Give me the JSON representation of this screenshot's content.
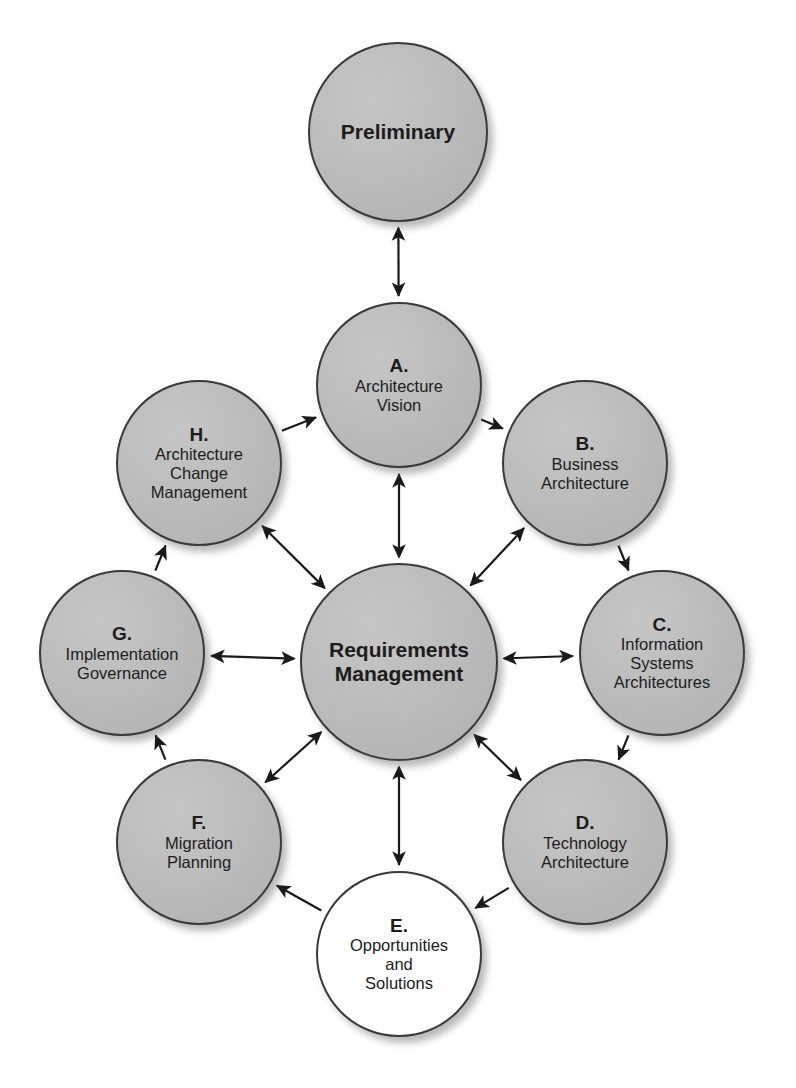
{
  "diagram": {
    "colors": {
      "node_fill": "#b9b9b9",
      "node_fill_white": "#ffffff",
      "node_border": "#3a3a3a",
      "arrow": "#1a1a1a",
      "background": "#ffffff"
    },
    "nodes": [
      {
        "id": "preliminary",
        "key": "",
        "text": "Preliminary",
        "fill": "gray",
        "bold": true,
        "cx": 398,
        "cy": 132,
        "r": 90
      },
      {
        "id": "phase-a",
        "key": "A.",
        "text": "Architecture\nVision",
        "fill": "gray",
        "bold": false,
        "cx": 399,
        "cy": 385,
        "r": 83
      },
      {
        "id": "phase-b",
        "key": "B.",
        "text": "Business\nArchitecture",
        "fill": "gray",
        "bold": false,
        "cx": 585,
        "cy": 463,
        "r": 83
      },
      {
        "id": "phase-c",
        "key": "C.",
        "text": "Information\nSystems\nArchitectures",
        "fill": "gray",
        "bold": false,
        "cx": 662,
        "cy": 653,
        "r": 83
      },
      {
        "id": "phase-d",
        "key": "D.",
        "text": "Technology\nArchitecture",
        "fill": "gray",
        "bold": false,
        "cx": 585,
        "cy": 842,
        "r": 83
      },
      {
        "id": "phase-e",
        "key": "E.",
        "text": "Opportunities\nand\nSolutions",
        "fill": "white",
        "bold": false,
        "cx": 399,
        "cy": 954,
        "r": 83
      },
      {
        "id": "phase-f",
        "key": "F.",
        "text": "Migration\nPlanning",
        "fill": "gray",
        "bold": false,
        "cx": 199,
        "cy": 842,
        "r": 83
      },
      {
        "id": "phase-g",
        "key": "G.",
        "text": "Implementation\nGovernance",
        "fill": "gray",
        "bold": false,
        "cx": 122,
        "cy": 653,
        "r": 83
      },
      {
        "id": "phase-h",
        "key": "H.",
        "text": "Architecture\nChange\nManagement",
        "fill": "gray",
        "bold": false,
        "cx": 199,
        "cy": 463,
        "r": 83
      },
      {
        "id": "requirements-management",
        "key": "",
        "text": "Requirements\nManagement",
        "fill": "gray",
        "bold": true,
        "cx": 399,
        "cy": 662,
        "r": 99
      }
    ],
    "connections": [
      {
        "id": "prelim-to-a",
        "from": "preliminary",
        "to": "phase-a",
        "style": "double",
        "ring": "vertical"
      },
      {
        "id": "a-to-b",
        "from": "phase-a",
        "to": "phase-b",
        "style": "single",
        "ring": "outer"
      },
      {
        "id": "b-to-c",
        "from": "phase-b",
        "to": "phase-c",
        "style": "single",
        "ring": "outer"
      },
      {
        "id": "c-to-d",
        "from": "phase-c",
        "to": "phase-d",
        "style": "single",
        "ring": "outer"
      },
      {
        "id": "d-to-e",
        "from": "phase-d",
        "to": "phase-e",
        "style": "single",
        "ring": "outer"
      },
      {
        "id": "e-to-f",
        "from": "phase-e",
        "to": "phase-f",
        "style": "single",
        "ring": "outer"
      },
      {
        "id": "f-to-g",
        "from": "phase-f",
        "to": "phase-g",
        "style": "single",
        "ring": "outer"
      },
      {
        "id": "g-to-h",
        "from": "phase-g",
        "to": "phase-h",
        "style": "single",
        "ring": "outer"
      },
      {
        "id": "h-to-a",
        "from": "phase-h",
        "to": "phase-a",
        "style": "single",
        "ring": "outer"
      },
      {
        "id": "rm-to-a",
        "from": "requirements-management",
        "to": "phase-a",
        "style": "double",
        "ring": "spoke"
      },
      {
        "id": "rm-to-b",
        "from": "requirements-management",
        "to": "phase-b",
        "style": "double",
        "ring": "spoke"
      },
      {
        "id": "rm-to-c",
        "from": "requirements-management",
        "to": "phase-c",
        "style": "double",
        "ring": "spoke"
      },
      {
        "id": "rm-to-d",
        "from": "requirements-management",
        "to": "phase-d",
        "style": "double",
        "ring": "spoke"
      },
      {
        "id": "rm-to-e",
        "from": "requirements-management",
        "to": "phase-e",
        "style": "double",
        "ring": "spoke"
      },
      {
        "id": "rm-to-f",
        "from": "requirements-management",
        "to": "phase-f",
        "style": "double",
        "ring": "spoke"
      },
      {
        "id": "rm-to-g",
        "from": "requirements-management",
        "to": "phase-g",
        "style": "double",
        "ring": "spoke"
      },
      {
        "id": "rm-to-h",
        "from": "requirements-management",
        "to": "phase-h",
        "style": "double",
        "ring": "spoke"
      }
    ]
  }
}
